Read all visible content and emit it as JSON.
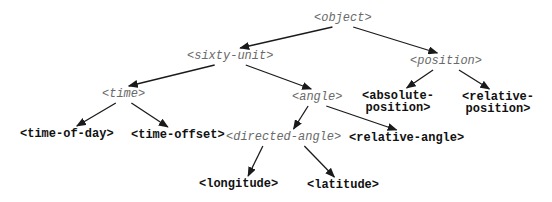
{
  "diagram": {
    "type": "class-hierarchy-tree",
    "nodes": [
      {
        "id": "object",
        "label": "<object>",
        "kind": "abstract"
      },
      {
        "id": "sixty-unit",
        "label": "<sixty-unit>",
        "kind": "abstract"
      },
      {
        "id": "position",
        "label": "<position>",
        "kind": "abstract"
      },
      {
        "id": "time",
        "label": "<time>",
        "kind": "abstract"
      },
      {
        "id": "angle",
        "label": "<angle>",
        "kind": "abstract"
      },
      {
        "id": "absolute-position",
        "label_lines": [
          "<absolute-",
          "position>"
        ],
        "kind": "concrete"
      },
      {
        "id": "relative-position",
        "label_lines": [
          "<relative-",
          "position>"
        ],
        "kind": "concrete"
      },
      {
        "id": "time-of-day",
        "label": "<time-of-day>",
        "kind": "concrete"
      },
      {
        "id": "time-offset",
        "label": "<time-offset>",
        "kind": "concrete"
      },
      {
        "id": "directed-angle",
        "label": "<directed-angle>",
        "kind": "abstract"
      },
      {
        "id": "relative-angle",
        "label": "<relative-angle>",
        "kind": "concrete"
      },
      {
        "id": "longitude",
        "label": "<longitude>",
        "kind": "concrete"
      },
      {
        "id": "latitude",
        "label": "<latitude>",
        "kind": "concrete"
      }
    ],
    "edges": [
      {
        "from": "object",
        "to": "sixty-unit"
      },
      {
        "from": "object",
        "to": "position"
      },
      {
        "from": "sixty-unit",
        "to": "time"
      },
      {
        "from": "sixty-unit",
        "to": "angle"
      },
      {
        "from": "position",
        "to": "absolute-position"
      },
      {
        "from": "position",
        "to": "relative-position"
      },
      {
        "from": "time",
        "to": "time-of-day"
      },
      {
        "from": "time",
        "to": "time-offset"
      },
      {
        "from": "angle",
        "to": "directed-angle"
      },
      {
        "from": "angle",
        "to": "relative-angle"
      },
      {
        "from": "directed-angle",
        "to": "longitude"
      },
      {
        "from": "directed-angle",
        "to": "latitude"
      }
    ]
  },
  "colors": {
    "abstract_text": "#6a6a6a",
    "concrete_text": "#111111",
    "edge": "#1a1a1a"
  }
}
